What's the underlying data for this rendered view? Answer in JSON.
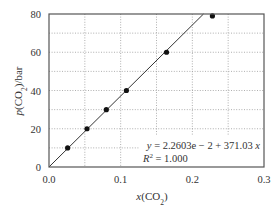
{
  "chart_data": {
    "type": "scatter",
    "title": "",
    "xlabel": "x(CO2)",
    "ylabel": "p(CO2)/bar",
    "xlim": [
      0.0,
      0.3
    ],
    "ylim": [
      0,
      80
    ],
    "x_ticks": [
      0.0,
      0.1,
      0.2,
      0.3
    ],
    "x_tick_labels": [
      "0.0",
      "0.1",
      "0.2",
      "0.3"
    ],
    "y_ticks": [
      0,
      20,
      40,
      60,
      80
    ],
    "y_tick_labels": [
      "0",
      "20",
      "40",
      "60",
      "80"
    ],
    "x_grid": [
      0.05,
      0.1,
      0.15,
      0.2,
      0.25
    ],
    "y_grid": [
      10,
      20,
      30,
      40,
      50,
      60,
      70
    ],
    "grid": true,
    "series": [
      {
        "name": "data",
        "marker": "circle",
        "x": [
          0.026,
          0.053,
          0.08,
          0.108,
          0.164,
          0.228
        ],
        "y": [
          10,
          20,
          30,
          40,
          60,
          79
        ]
      }
    ],
    "fit": {
      "intercept": 0.022603,
      "slope": 371.03,
      "equation": "y = 2.2603e − 2 + 371.03x",
      "r2": "R² = 1.000"
    },
    "annotations": [
      "y = 2.2603e − 2 + 371.03x",
      "R² = 1.000"
    ]
  }
}
